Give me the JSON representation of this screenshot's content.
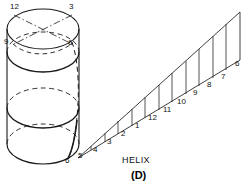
{
  "figure": {
    "caption_helix": "HELIX",
    "caption_panel": "(D)",
    "stroke_color": "#1a1a1a",
    "background_color": "#ffffff"
  },
  "cylinder": {
    "name": "helix-on-cylinder",
    "labels": [
      {
        "text": "12",
        "x": 10,
        "y": 5,
        "anchor": "top-left-of-top-ellipse"
      },
      {
        "text": "3",
        "x": 69,
        "y": 5,
        "anchor": "top-right-of-top-ellipse"
      },
      {
        "text": "9",
        "x": 6,
        "y": 41,
        "anchor": "left-of-second-ellipse"
      },
      {
        "text": "6",
        "x": 68,
        "y": 42,
        "anchor": "right-of-second-ellipse"
      },
      {
        "text": "6",
        "x": 67,
        "y": 160,
        "anchor": "bottom-of-cylinder"
      }
    ],
    "top_ellipse": {
      "cx": 43,
      "cy": 29,
      "rx": 36,
      "ry": 20
    },
    "second_ellipse": {
      "cx": 43,
      "cy": 52,
      "rx": 36,
      "ry": 20
    },
    "middle_ellipse": {
      "cx": 43,
      "cy": 108,
      "rx": 36,
      "ry": 20
    },
    "bottom_ellipse": {
      "cx": 43,
      "cy": 144,
      "rx": 36,
      "ry": 20
    }
  },
  "development": {
    "name": "helix-development-triangle",
    "description": "unrolled helix shown as a sloping line over twelve equal divisions",
    "apex_x": 78,
    "apex_y": 158,
    "right_x": 240,
    "base_y": 158,
    "top_y": 12,
    "divisions": 12,
    "station_labels": [
      "5",
      "4",
      "3",
      "2",
      "1",
      "12",
      "11",
      "10",
      "9",
      "8",
      "7",
      "6"
    ],
    "stations": [
      {
        "text": "5",
        "x": 81,
        "y": 155
      },
      {
        "text": "4",
        "x": 95,
        "y": 149
      },
      {
        "text": "3",
        "x": 110,
        "y": 140
      },
      {
        "text": "2",
        "x": 126,
        "y": 131
      },
      {
        "text": "1",
        "x": 141,
        "y": 122
      },
      {
        "text": "12",
        "x": 153,
        "y": 114
      },
      {
        "text": "11",
        "x": 169,
        "y": 105
      },
      {
        "text": "10",
        "x": 184,
        "y": 96
      },
      {
        "text": "9",
        "x": 199,
        "y": 87
      },
      {
        "text": "8",
        "x": 214,
        "y": 78
      },
      {
        "text": "7",
        "x": 229,
        "y": 70
      },
      {
        "text": "6",
        "x": 241,
        "y": 62
      }
    ]
  }
}
